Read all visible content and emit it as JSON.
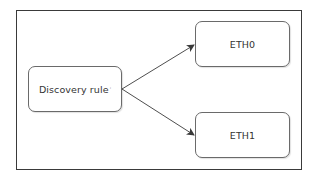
{
  "diagram": {
    "type": "flow",
    "nodes": [
      {
        "id": "rule",
        "label": "Discovery rule",
        "mark": "'"
      },
      {
        "id": "eth0",
        "label": "ETH0"
      },
      {
        "id": "eth1",
        "label": "ETH1"
      }
    ],
    "edges": [
      {
        "from": "rule",
        "to": "eth0",
        "style": "arrow"
      },
      {
        "from": "rule",
        "to": "eth1",
        "style": "arrow"
      }
    ],
    "colors": {
      "frame_border": "#3a3a3a",
      "node_border": "#6a6a6a",
      "edge": "#3a3a3a",
      "text": "#333333",
      "background": "#ffffff"
    }
  }
}
